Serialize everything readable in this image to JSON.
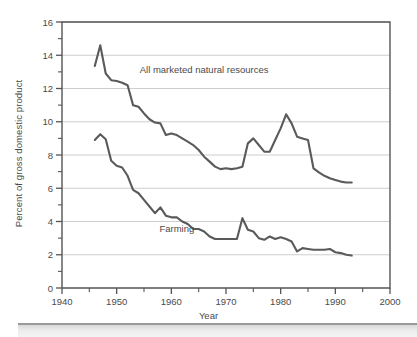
{
  "chart_data": {
    "type": "line",
    "title": "",
    "xlabel": "Year",
    "ylabel": "Percent of gross domestic product",
    "xlim": [
      1940,
      2000
    ],
    "ylim": [
      0,
      16
    ],
    "x_ticks": [
      1940,
      1950,
      1960,
      1970,
      1980,
      1990,
      2000
    ],
    "x_tick_labels": [
      "1940",
      "1950",
      "1960",
      "1970",
      "1980",
      "1990",
      "2000"
    ],
    "x_minor_ticks": [
      1945,
      1955,
      1965,
      1975,
      1985,
      1995
    ],
    "y_ticks": [
      0,
      2,
      4,
      6,
      8,
      10,
      12,
      14,
      16
    ],
    "y_tick_labels": [
      "0",
      "2",
      "4",
      "6",
      "8",
      "10",
      "12",
      "14",
      "16"
    ],
    "y_minor_ticks": [
      1,
      3,
      5,
      7,
      9,
      11,
      13,
      15
    ],
    "grid": "horizontal",
    "legend_position": "inline-annotation",
    "line_color": "#5a5a5a",
    "grid_color": "#c8c8c8",
    "frame_color": "#555555",
    "series": [
      {
        "name": "All marketed natural resources",
        "label_x": 1966,
        "label_y": 12.95,
        "x": [
          1946,
          1947,
          1948,
          1949,
          1950,
          1951,
          1952,
          1953,
          1954,
          1955,
          1956,
          1957,
          1958,
          1959,
          1960,
          1961,
          1962,
          1963,
          1964,
          1965,
          1966,
          1967,
          1968,
          1969,
          1970,
          1971,
          1972,
          1973,
          1974,
          1975,
          1976,
          1977,
          1978,
          1979,
          1980,
          1981,
          1982,
          1983,
          1984,
          1985,
          1986,
          1987,
          1988,
          1989,
          1990,
          1991,
          1992,
          1993
        ],
        "values": [
          13.35,
          14.6,
          12.9,
          12.5,
          12.45,
          12.35,
          12.2,
          11.0,
          10.9,
          10.5,
          10.15,
          9.95,
          9.9,
          9.2,
          9.3,
          9.2,
          9.0,
          8.8,
          8.6,
          8.3,
          7.9,
          7.6,
          7.3,
          7.15,
          7.2,
          7.15,
          7.2,
          7.3,
          8.7,
          9.0,
          8.6,
          8.2,
          8.2,
          8.9,
          9.6,
          10.45,
          9.9,
          9.1,
          9.0,
          8.9,
          7.2,
          6.95,
          6.75,
          6.6,
          6.5,
          6.4,
          6.35,
          6.35
        ]
      },
      {
        "name": "Farming",
        "label_x": 1961,
        "label_y": 3.35,
        "x": [
          1946,
          1947,
          1948,
          1949,
          1950,
          1951,
          1952,
          1953,
          1954,
          1955,
          1956,
          1957,
          1958,
          1959,
          1960,
          1961,
          1962,
          1963,
          1964,
          1965,
          1966,
          1967,
          1968,
          1969,
          1970,
          1971,
          1972,
          1973,
          1974,
          1975,
          1976,
          1977,
          1978,
          1979,
          1980,
          1981,
          1982,
          1983,
          1984,
          1985,
          1986,
          1987,
          1988,
          1989,
          1990,
          1991,
          1992,
          1993
        ],
        "values": [
          8.9,
          9.25,
          8.95,
          7.65,
          7.35,
          7.25,
          6.75,
          5.9,
          5.7,
          5.3,
          4.9,
          4.5,
          4.85,
          4.35,
          4.25,
          4.25,
          4.0,
          3.85,
          3.55,
          3.55,
          3.4,
          3.1,
          2.95,
          2.95,
          2.95,
          2.95,
          2.95,
          4.2,
          3.5,
          3.4,
          3.0,
          2.9,
          3.1,
          2.95,
          3.05,
          2.95,
          2.8,
          2.2,
          2.4,
          2.35,
          2.3,
          2.3,
          2.3,
          2.35,
          2.15,
          2.1,
          2.0,
          1.95
        ]
      }
    ]
  }
}
